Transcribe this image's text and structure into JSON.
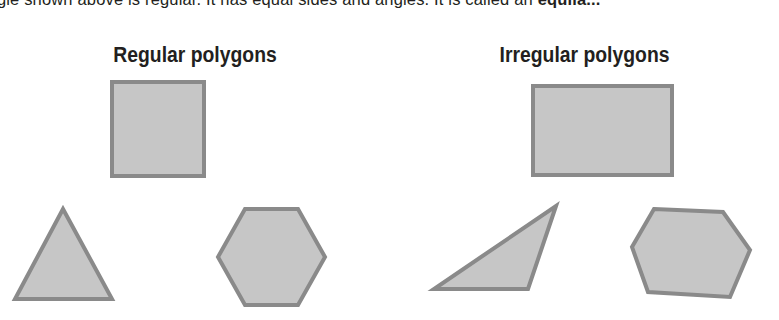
{
  "intro": {
    "text_before": "...angle shown above is regular. It has equal sides and angles. It is called an ",
    "text_bold": "equila..."
  },
  "headings": {
    "left": "Regular polygons",
    "right": "Irregular polygons"
  },
  "colors": {
    "shape_fill": "#c6c6c6",
    "shape_stroke": "#8a8a8a",
    "text": "#231f20",
    "background": "#ffffff"
  },
  "shapes": {
    "regular": [
      {
        "name": "square",
        "label": "Regular square",
        "sides": 4,
        "points": "112,82 204,82 204,176 112,176"
      },
      {
        "name": "equilateral-triangle",
        "label": "Regular triangle",
        "sides": 3,
        "points": "63,209 112,299 15,299"
      },
      {
        "name": "regular-hexagon",
        "label": "Regular hexagon",
        "sides": 6,
        "points": "245,209 298,209 325,257 298,305 245,305 218,257"
      }
    ],
    "irregular": [
      {
        "name": "rectangle",
        "label": "Irregular rectangle",
        "sides": 4,
        "points": "533,86 672,86 672,175 533,175"
      },
      {
        "name": "scalene-triangle",
        "label": "Irregular triangle",
        "sides": 3,
        "points": "556,206 528,289 434,289"
      },
      {
        "name": "irregular-hexagon",
        "label": "Irregular hexagon",
        "sides": 6,
        "points": "654,209 723,212 750,250 730,297 648,292 632,247"
      }
    ]
  }
}
